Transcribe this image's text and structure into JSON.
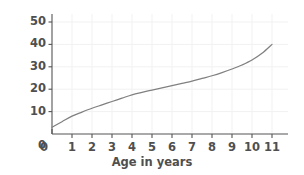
{
  "chart_data": {
    "type": "line",
    "title": "",
    "xlabel": "Age in years",
    "ylabel": "Average mass (kilograms)",
    "xlim": [
      0,
      11.4
    ],
    "ylim": [
      0,
      55
    ],
    "xticks": [
      "0",
      "1",
      "2",
      "3",
      "4",
      "5",
      "6",
      "7",
      "8",
      "9",
      "10",
      "11"
    ],
    "xtick_values": [
      0,
      1,
      2,
      3,
      4,
      5,
      6,
      7,
      8,
      9,
      10,
      11
    ],
    "yticks": [
      "0",
      "10",
      "20",
      "30",
      "40",
      "50"
    ],
    "ytick_values": [
      0,
      10,
      20,
      30,
      40,
      50
    ],
    "grid": true,
    "legend": false,
    "series": [
      {
        "name": "Average mass",
        "x": [
          0,
          0.5,
          1,
          1.5,
          2,
          2.5,
          3,
          3.5,
          4,
          4.5,
          5,
          5.5,
          6,
          6.5,
          7,
          7.5,
          8,
          8.5,
          9,
          9.5,
          10,
          10.5,
          11
        ],
        "values": [
          3,
          5.5,
          8,
          9.8,
          11.5,
          13,
          14.5,
          16,
          17.5,
          18.6,
          19.6,
          20.6,
          21.6,
          22.6,
          23.6,
          24.8,
          26,
          27.4,
          29,
          30.8,
          33,
          36,
          40
        ]
      }
    ],
    "colors": {
      "line": "#808080",
      "axis": "#555555",
      "grid": "#f1f1f1",
      "text": "#4f4f4f",
      "background": "#ffffff"
    }
  }
}
